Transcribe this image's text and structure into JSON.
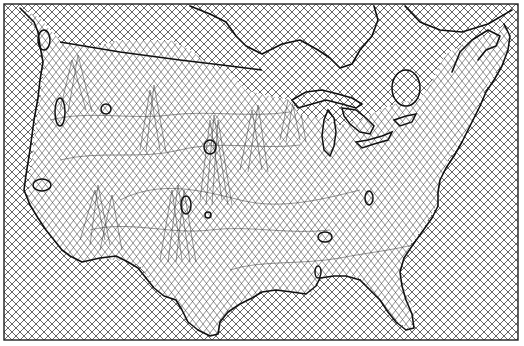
{
  "figure": {
    "type": "cartogram-mesh-map",
    "region": "contiguous-united-states",
    "colors": {
      "background": "#ffffff",
      "grid": "#555555",
      "outline": "#111111",
      "frame": "#222222"
    },
    "grid_spacing_px": 8,
    "features": {
      "coastline": "coastline",
      "canada_border": "us-canada-border",
      "great_lakes": "great-lakes",
      "lakes": [
        "great-salt-lake",
        "lake-tahoe-region",
        "lake-okeechobee-region",
        "reservoirs"
      ]
    }
  }
}
